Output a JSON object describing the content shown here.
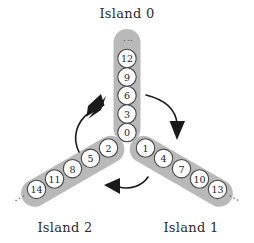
{
  "diagram": {
    "title_visible": false,
    "islands": [
      {
        "id": "island-0",
        "label": "Island 0",
        "orientation": "vertical",
        "nodes": [
          "0",
          "3",
          "6",
          "9",
          "12"
        ],
        "overflow_marker": "⋮"
      },
      {
        "id": "island-1",
        "label": "Island 1",
        "orientation": "diagonal-down-right",
        "nodes": [
          "1",
          "4",
          "7",
          "10",
          "13"
        ],
        "overflow_marker": "···"
      },
      {
        "id": "island-2",
        "label": "Island 2",
        "orientation": "diagonal-down-left",
        "nodes": [
          "2",
          "5",
          "8",
          "11",
          "14"
        ],
        "overflow_marker": "···"
      }
    ],
    "arrows": [
      {
        "id": "arrow-island0-to-island1",
        "from": "island-0",
        "to": "island-1",
        "direction": "down-right"
      },
      {
        "id": "arrow-island1-to-island2",
        "from": "island-1",
        "to": "island-2",
        "direction": "left"
      },
      {
        "id": "arrow-island2-to-island0",
        "from": "island-2",
        "to": "island-0",
        "direction": "up-right"
      }
    ],
    "colors": {
      "capsule": "#b9b9b9",
      "node_fill": "#fdfdfd",
      "node_stroke": "#4a4a4a",
      "arrow": "#1a1a1a",
      "label_text": "#2b2b2b",
      "background": "#ffffff"
    }
  }
}
